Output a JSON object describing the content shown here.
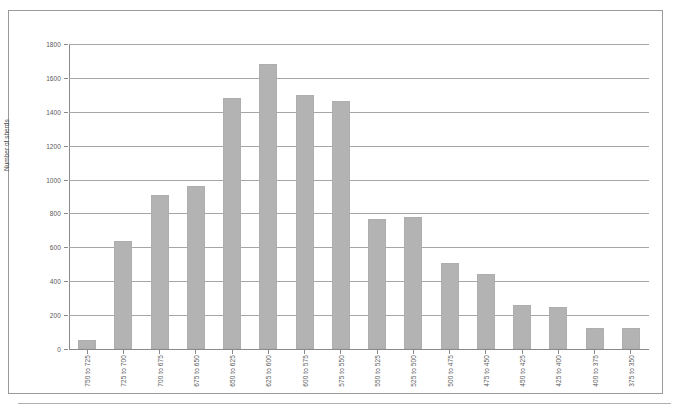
{
  "chart_data": {
    "type": "bar",
    "title": "",
    "subtitle": "",
    "xlabel": "",
    "ylabel": "Number of sherds",
    "ylim": [
      0,
      1800
    ],
    "ytick_step": 200,
    "yticks": [
      0,
      200,
      400,
      600,
      800,
      1000,
      1200,
      1400,
      1600,
      1800
    ],
    "ytick_labels": [
      "0",
      "200",
      "400",
      "600",
      "800",
      "1000",
      "1200",
      "1400",
      "1600",
      "1800"
    ],
    "grid": true,
    "legend": false,
    "legend_position": "none",
    "bar_color": "#b3b3b3",
    "categories": [
      "750 to 725",
      "725 to 700",
      "700 to 675",
      "675 to 650",
      "650 to 625",
      "625 to 600",
      "600 to 575",
      "575 to 550",
      "550 to 525",
      "525 to 500",
      "500 to 475",
      "475 to 450",
      "450 to 425",
      "425 to 400",
      "400 to 375",
      "375 to 350"
    ],
    "values": [
      55,
      640,
      910,
      965,
      1480,
      1685,
      1500,
      1465,
      770,
      780,
      505,
      440,
      260,
      250,
      125,
      125
    ]
  },
  "figure": {
    "axis_color": "#8a8a8a",
    "grid_color": "#a6a6a6",
    "frame_color": "#9a9a9a",
    "background": "#ffffff"
  }
}
